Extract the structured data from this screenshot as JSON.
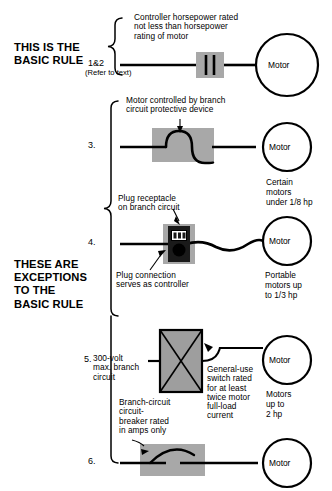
{
  "diagram": {
    "title_blocks": [
      {
        "id": "basic-rule",
        "text": "THIS IS THE\nBASIC RULE"
      },
      {
        "id": "exceptions",
        "text": "THESE ARE\nEXCEPTIONS\nTO THE\nBASIC RULE"
      }
    ],
    "motor_label": "Motor",
    "rows": [
      {
        "id": "row-1",
        "number": "1&2",
        "subnumber": "(Refer to text)",
        "caption_above": "Controller horsepower rated\nnot less than horsepower\nrating of motor",
        "caption_below": "",
        "right_label": "",
        "symbol": "contactor-symbol",
        "motor": "Motor"
      },
      {
        "id": "row-3",
        "number": "3.",
        "subnumber": "",
        "caption_above": "Motor controlled by branch\ncircuit protective device",
        "caption_below": "",
        "right_label": "Certain\nmotors\nunder 1/8 hp",
        "symbol": "protective-device-symbol",
        "motor": "Motor"
      },
      {
        "id": "row-4",
        "number": "4.",
        "subnumber": "",
        "caption_above": "Plug receptacle\non branch circuit",
        "caption_below": "Plug connection\nserves as controller",
        "right_label": "Portable\nmotors up\nto 1/3 hp",
        "symbol": "plug-receptacle-symbol",
        "motor": "Motor"
      },
      {
        "id": "row-5",
        "number": "5.",
        "subnumber": "300-volt\nmax. branch\ncircuit",
        "caption_above": "",
        "caption_below": "Branch-circuit\ncircuit-\nbreaker rated\nin amps only",
        "caption_right": "General-use\nswitch rated\nfor at least\ntwice motor\nfull-load\ncurrent",
        "right_label": "Motors\nup to\n2 hp",
        "symbol": "general-use-switch-symbol",
        "motor": "Motor"
      },
      {
        "id": "row-6",
        "number": "6.",
        "subnumber": "",
        "caption_above": "",
        "caption_below": "",
        "right_label": "",
        "symbol": "circuit-breaker-symbol",
        "motor": "Motor"
      }
    ],
    "colors": {
      "ink": "#000000",
      "paper": "#ffffff",
      "shade": "#a8a8a8",
      "shade_light": "#b5b5b5"
    }
  }
}
